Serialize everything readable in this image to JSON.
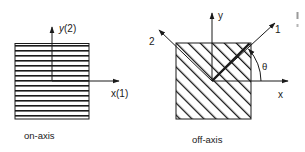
{
  "figure": {
    "panels": [
      {
        "id": "on-axis",
        "caption": "on-axis",
        "hatch": "horizontal",
        "axes": {
          "x_label": "x(1)",
          "y_label": "y(2)"
        }
      },
      {
        "id": "off-axis",
        "caption": "off-axis",
        "hatch": "diagonal-45",
        "axes": {
          "x_label": "x",
          "y_label": "y",
          "axis1_label": "1",
          "axis2_label": "2",
          "angle_label": "θ"
        }
      }
    ]
  },
  "colors": {
    "ink": "#1a1a1a",
    "background": "#ffffff",
    "edge_fragment": "#9a9a9a"
  }
}
